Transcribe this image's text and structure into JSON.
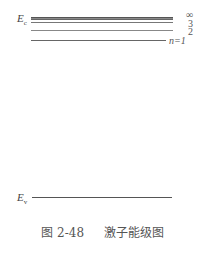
{
  "diagram": {
    "conduction_band_label": "E",
    "conduction_band_sub": "c",
    "valence_band_label": "E",
    "valence_band_sub": "v",
    "levels": [
      {
        "label": "∞"
      },
      {
        "label": "3"
      },
      {
        "label": "2"
      },
      {
        "label": "n=1"
      }
    ]
  },
  "caption": {
    "figure_number": "图 2-48",
    "title": "激子能级图"
  }
}
